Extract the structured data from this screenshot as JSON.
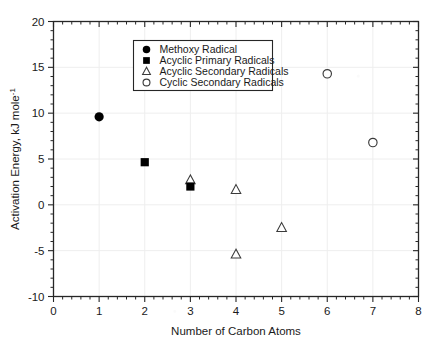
{
  "chart_data": {
    "type": "scatter",
    "title": "",
    "xlabel": "Number of Carbon Atoms",
    "ylabel": "Activation Energy, kJ mole",
    "ylabel_superscript": "-1",
    "xlim": [
      0,
      8
    ],
    "ylim": [
      -10,
      20
    ],
    "xticks": [
      0,
      1,
      2,
      3,
      4,
      5,
      6,
      7,
      8
    ],
    "yticks": [
      -10,
      -5,
      0,
      5,
      10,
      15,
      20
    ],
    "xtick_labels": [
      "0",
      "1",
      "2",
      "3",
      "4",
      "5",
      "6",
      "7",
      "8"
    ],
    "ytick_labels": [
      "-10",
      "-5",
      "0",
      "5",
      "10",
      "15",
      "20"
    ],
    "x_minor_ticks_per_interval": 5,
    "y_minor_ticks_per_interval": 5,
    "grid": true,
    "grid_color": "#eeeeee",
    "frame": true,
    "legend_position": "upper-center-left",
    "series": [
      {
        "name": "Methoxy Radical",
        "marker": "filled-circle",
        "color": "#000000",
        "points": [
          {
            "x": 1,
            "y": 9.6
          }
        ]
      },
      {
        "name": "Acyclic Primary Radicals",
        "marker": "filled-square",
        "color": "#000000",
        "points": [
          {
            "x": 2,
            "y": 4.65
          },
          {
            "x": 3,
            "y": 2.0
          }
        ]
      },
      {
        "name": "Acyclic Secondary Radicals",
        "marker": "open-triangle",
        "color": "#000000",
        "points": [
          {
            "x": 3,
            "y": 2.7
          },
          {
            "x": 4,
            "y": 1.65
          },
          {
            "x": 4,
            "y": -5.4
          },
          {
            "x": 5,
            "y": -2.5
          }
        ]
      },
      {
        "name": "Cyclic Secondary Radicals",
        "marker": "open-circle",
        "color": "#000000",
        "points": [
          {
            "x": 6,
            "y": 14.3
          },
          {
            "x": 7,
            "y": 6.8
          }
        ]
      }
    ]
  },
  "legend": {
    "entries": [
      {
        "label": "Methoxy Radical",
        "marker": "filled-circle"
      },
      {
        "label": "Acyclic Primary Radicals",
        "marker": "filled-square"
      },
      {
        "label": "Acyclic Secondary Radicals",
        "marker": "open-triangle"
      },
      {
        "label": "Cyclic Secondary Radicals",
        "marker": "open-circle"
      }
    ]
  }
}
